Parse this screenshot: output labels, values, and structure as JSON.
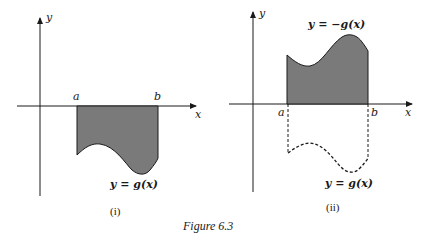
{
  "figure": {
    "caption": "Figure 6.3",
    "panel_i": {
      "label": "(i)",
      "x_axis_label": "x",
      "y_axis_label": "y",
      "point_a": "a",
      "point_b": "b",
      "curve_label": "y = g(x)"
    },
    "panel_ii": {
      "label": "(ii)",
      "x_axis_label": "x",
      "y_axis_label": "y",
      "point_a": "a",
      "point_b": "b",
      "upper_curve_label": "y = −g(x)",
      "lower_curve_label": "y = g(x)"
    },
    "colors": {
      "fill": "#7a7a7a",
      "stroke": "#1a1a1a"
    }
  }
}
